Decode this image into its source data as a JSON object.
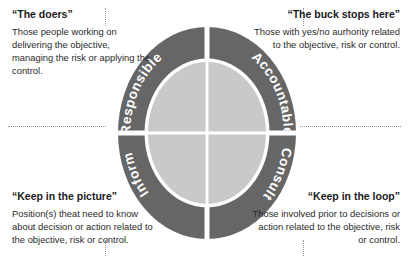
{
  "diagram": {
    "colors": {
      "ring": "#666666",
      "inner": "#c9c9c9",
      "divider": "#ffffff",
      "background": "#ffffff",
      "text": "#1c1c1c",
      "guide": "#9a9a9a"
    },
    "segments": [
      {
        "key": "responsible",
        "label": "Responsible",
        "position": "top-left"
      },
      {
        "key": "accountable",
        "label": "Accountable",
        "position": "top-right"
      },
      {
        "key": "inform",
        "label": "Inform",
        "position": "bottom-left"
      },
      {
        "key": "consult",
        "label": "Consult",
        "position": "bottom-right"
      }
    ]
  },
  "blocks": {
    "top_left": {
      "heading": "“The doers”",
      "body": "Those people working on delivering the objective, managing the risk or applying the control."
    },
    "top_right": {
      "heading": "“The buck stops here”",
      "body": "Those with yes/no aurhority related to the objective, risk or control."
    },
    "bottom_left": {
      "heading": "“Keep in the picture”",
      "body": "Position(s) theat need to know about decision or action related to the objective, risk or control."
    },
    "bottom_right": {
      "heading": "“Keep in the loop”",
      "body": "Those involved prior to decisions or action related to the objective, risk or control."
    }
  }
}
